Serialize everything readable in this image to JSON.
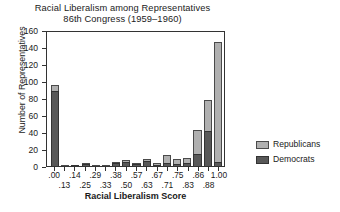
{
  "chart_data": {
    "type": "bar",
    "title": "Racial Liberalism among Representatives",
    "subtitle": "86th Congress (1959–1960)",
    "xlabel": "Racial Liberalism Score",
    "ylabel": "Number of Representatives",
    "ylim": [
      0,
      160
    ],
    "ytick_values": [
      160,
      140,
      120,
      100,
      80,
      60,
      40,
      20,
      0
    ],
    "ytick_labels": [
      "160",
      "140",
      "120",
      "100",
      "80",
      "60",
      "40",
      "20",
      "0"
    ],
    "grid": false,
    "stacked": true,
    "legend_position": "right",
    "categories": [
      ".00",
      ".13",
      ".14",
      ".25",
      ".29",
      ".33",
      ".38",
      ".50",
      ".57",
      ".63",
      ".67",
      ".71",
      ".75",
      ".83",
      ".86",
      ".88",
      "1.00"
    ],
    "xtick_label_rows": [
      {
        "row": "top",
        "labels": [
          ".00",
          "",
          ".14",
          "",
          ".29",
          "",
          ".38",
          "",
          ".57",
          "",
          ".67",
          "",
          ".75",
          "",
          ".86",
          "",
          "1.00"
        ]
      },
      {
        "row": "bottom",
        "labels": [
          "",
          ".13",
          "",
          ".25",
          "",
          ".33",
          "",
          ".50",
          "",
          ".63",
          "",
          ".71",
          "",
          ".83",
          "",
          ".88",
          ""
        ]
      }
    ],
    "series": [
      {
        "name": "Democrats",
        "color": "#585858",
        "values": [
          88,
          0,
          1,
          2,
          0,
          0,
          3,
          5,
          2,
          6,
          1,
          4,
          2,
          3,
          14,
          41,
          5
        ]
      },
      {
        "name": "Republicans",
        "color": "#b0b0b0",
        "values": [
          7,
          1,
          0,
          1,
          1,
          1,
          1,
          2,
          1,
          2,
          1,
          9,
          6,
          6,
          28,
          37,
          141
        ]
      }
    ],
    "totals": [
      95,
      1,
      1,
      3,
      1,
      1,
      4,
      7,
      3,
      8,
      2,
      13,
      8,
      9,
      42,
      78,
      146
    ]
  },
  "legend": {
    "entries": [
      {
        "label": "Republicans",
        "swatch": "republicans-swatch"
      },
      {
        "label": "Democrats",
        "swatch": "democrats-swatch"
      }
    ]
  }
}
